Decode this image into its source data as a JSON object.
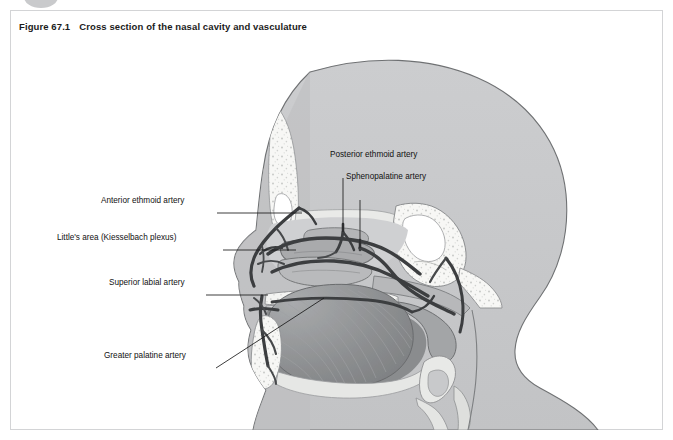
{
  "figure": {
    "number": "Figure 67.1",
    "title": "Cross section of the nasal cavity and vasculature"
  },
  "labels": {
    "anterior_ethmoid": "Anterior ethmoid artery",
    "littles_area": "Little's area (Kiesselbach plexus)",
    "superior_labial": "Superior labial artery",
    "greater_palatine": "Greater palatine artery",
    "posterior_ethmoid": "Posterior ethmoid artery",
    "sphenopalatine": "Sphenopalatine artery"
  },
  "colors": {
    "page_background": "#ffffff",
    "panel_border": "#d3d4d6",
    "title_text": "#1b1b1b",
    "label_text": "#111111",
    "leader_line": "#1a1a1a",
    "head_fill": "#c8c9cb",
    "head_outline": "#6f7173",
    "skin_inner": "#b9babc",
    "bone_white": "#f7f7f5",
    "bone_outline": "#8d8f91",
    "mucosa_mid": "#a9aaac",
    "mucosa_light": "#d6d7d8",
    "tongue_fill": "#8e9092",
    "artery_dark": "#3c3e40",
    "artery_mid": "#5a5c5e",
    "cavity_dark": "#7b7d7f",
    "bubble_gray": "#c9cacc"
  }
}
